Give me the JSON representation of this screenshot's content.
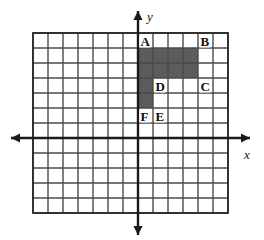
{
  "figure": {
    "grid": {
      "columns": 13,
      "rows": 12,
      "cell_size": 15,
      "left": 33,
      "top": 33,
      "line_color": "#4a4a4a",
      "border_color": "#2b2b2b",
      "background": "#ffffff"
    },
    "axes": {
      "color": "#1a1a1a",
      "origin_col": 7,
      "origin_row": 7,
      "x_label": "x",
      "y_label": "y",
      "x_axis_name": "x-axis",
      "y_axis_name": "y-axis",
      "arrow_left": true,
      "arrow_right": true,
      "arrow_up": true,
      "arrow_down": true
    },
    "shaded": {
      "color": "#5c5c5c",
      "description": "T-shaped shaded region of unit squares",
      "cells": [
        {
          "col": 7,
          "row": 1
        },
        {
          "col": 8,
          "row": 1
        },
        {
          "col": 9,
          "row": 1
        },
        {
          "col": 10,
          "row": 1
        },
        {
          "col": 7,
          "row": 2
        },
        {
          "col": 8,
          "row": 2
        },
        {
          "col": 9,
          "row": 2
        },
        {
          "col": 10,
          "row": 2
        },
        {
          "col": 7,
          "row": 3
        },
        {
          "col": 7,
          "row": 4
        }
      ]
    },
    "labels": [
      {
        "id": "A",
        "text": "A",
        "col": 7,
        "row": 0,
        "anchor": "left-bottom"
      },
      {
        "id": "B",
        "text": "B",
        "col": 11,
        "row": 0,
        "anchor": "left-bottom"
      },
      {
        "id": "C",
        "text": "C",
        "col": 11,
        "row": 3,
        "anchor": "left-bottom"
      },
      {
        "id": "D",
        "text": "D",
        "col": 8,
        "row": 3,
        "anchor": "left-bottom"
      },
      {
        "id": "E",
        "text": "E",
        "col": 8,
        "row": 5,
        "anchor": "left-bottom"
      },
      {
        "id": "F",
        "text": "F",
        "col": 7,
        "row": 5,
        "anchor": "left-bottom"
      }
    ]
  }
}
